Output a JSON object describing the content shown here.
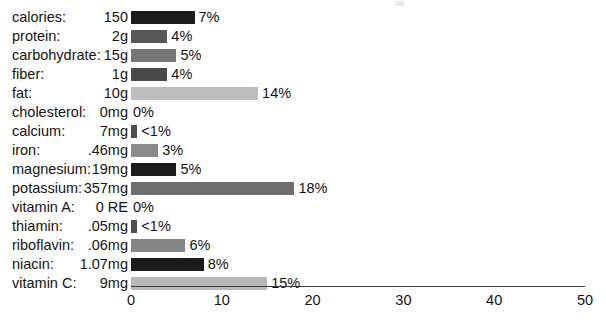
{
  "chart_data": {
    "type": "bar",
    "orientation": "horizontal",
    "title": "",
    "subtitle": "",
    "xlabel": "",
    "ylabel": "",
    "xlim": [
      0,
      50
    ],
    "xticks": [
      0,
      10,
      20,
      30,
      40,
      50
    ],
    "xtick_labels": [
      "0",
      "10",
      "20",
      "30",
      "40",
      "50"
    ],
    "grid": false,
    "legend": "none",
    "value_suffix": "%",
    "categories": [
      "calories:",
      "protein:",
      "carbohydrate:",
      "fiber:",
      "fat:",
      "cholesterol:",
      "calcium:",
      "iron:",
      "magnesium:",
      "potassium:",
      "vitamin A:",
      "thiamin:",
      "riboflavin:",
      "niacin:",
      "vitamin C:"
    ],
    "amounts": [
      "150",
      "2g",
      "15g",
      "1g",
      "10g",
      "0mg",
      "7mg",
      ".46mg",
      "19mg",
      "357mg",
      "0 RE",
      ".05mg",
      ".06mg",
      "1.07mg",
      "9mg"
    ],
    "values": [
      7,
      4,
      5,
      4,
      14,
      0,
      0.7,
      3,
      5,
      18,
      0,
      0.7,
      6,
      8,
      15
    ],
    "value_labels": [
      "7%",
      "4%",
      "5%",
      "4%",
      "14%",
      "0%",
      "<1%",
      "3%",
      "5%",
      "18%",
      "0%",
      "<1%",
      "6%",
      "8%",
      "15%"
    ],
    "bar_colors": [
      "#1c1c1c",
      "#575757",
      "#767676",
      "#4a4a4a",
      "#bdbdbd",
      "#ffffff",
      "#4f4f4f",
      "#8a8a8a",
      "#1c1c1c",
      "#6e6e6e",
      "#ffffff",
      "#4f4f4f",
      "#858585",
      "#1c1c1c",
      "#b8b8b8"
    ],
    "rows": [
      {
        "label": "calories:",
        "amount": "150",
        "value": 7,
        "value_label": "7%",
        "color": "#1c1c1c"
      },
      {
        "label": "protein:",
        "amount": "2g",
        "value": 4,
        "value_label": "4%",
        "color": "#575757"
      },
      {
        "label": "carbohydrate:",
        "amount": "15g",
        "value": 5,
        "value_label": "5%",
        "color": "#767676"
      },
      {
        "label": "fiber:",
        "amount": "1g",
        "value": 4,
        "value_label": "4%",
        "color": "#4a4a4a"
      },
      {
        "label": "fat:",
        "amount": "10g",
        "value": 14,
        "value_label": "14%",
        "color": "#bdbdbd"
      },
      {
        "label": "cholesterol:",
        "amount": "0mg",
        "value": 0,
        "value_label": "0%",
        "color": "#ffffff"
      },
      {
        "label": "calcium:",
        "amount": "7mg",
        "value": 0.7,
        "value_label": "<1%",
        "color": "#4f4f4f"
      },
      {
        "label": "iron:",
        "amount": ".46mg",
        "value": 3,
        "value_label": "3%",
        "color": "#8a8a8a"
      },
      {
        "label": "magnesium:",
        "amount": "19mg",
        "value": 5,
        "value_label": "5%",
        "color": "#1c1c1c"
      },
      {
        "label": "potassium:",
        "amount": "357mg",
        "value": 18,
        "value_label": "18%",
        "color": "#6e6e6e"
      },
      {
        "label": "vitamin A:",
        "amount": "0 RE",
        "value": 0,
        "value_label": "0%",
        "color": "#ffffff"
      },
      {
        "label": "thiamin:",
        "amount": ".05mg",
        "value": 0.7,
        "value_label": "<1%",
        "color": "#4f4f4f"
      },
      {
        "label": "riboflavin:",
        "amount": ".06mg",
        "value": 6,
        "value_label": "6%",
        "color": "#858585"
      },
      {
        "label": "niacin:",
        "amount": "1.07mg",
        "value": 8,
        "value_label": "8%",
        "color": "#1c1c1c"
      },
      {
        "label": "vitamin C:",
        "amount": "9mg",
        "value": 15,
        "value_label": "15%",
        "color": "#b8b8b8"
      }
    ]
  },
  "colors": {
    "background": "#ffffff",
    "text": "#141414",
    "axis": "#3a3a3a"
  }
}
